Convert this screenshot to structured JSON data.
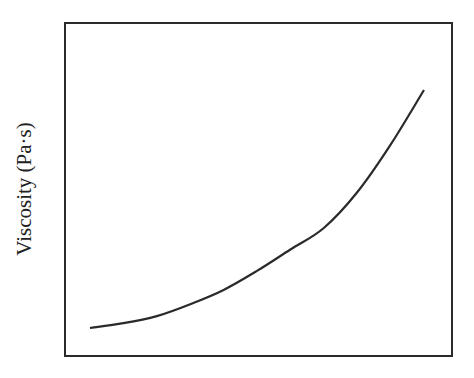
{
  "chart_data": {
    "type": "line",
    "title": "",
    "xlabel": "",
    "ylabel": "Viscosity (Pa·s)",
    "x_ticks": [],
    "y_ticks": [],
    "grid": false,
    "legend": null,
    "series": [
      {
        "name": "viscosity",
        "description": "Monotonically increasing, convex (upward-curving) trend with no numeric axis values shown",
        "x": [
          0.0,
          0.1,
          0.2,
          0.3,
          0.4,
          0.5,
          0.6,
          0.7,
          0.8,
          0.9,
          1.0
        ],
        "y": [
          0.0,
          0.02,
          0.05,
          0.1,
          0.16,
          0.24,
          0.33,
          0.42,
          0.57,
          0.77,
          1.0
        ]
      }
    ],
    "colors": {
      "line": "#2a2a2a",
      "axes": "#2a2a2a",
      "background": "#ffffff"
    }
  }
}
